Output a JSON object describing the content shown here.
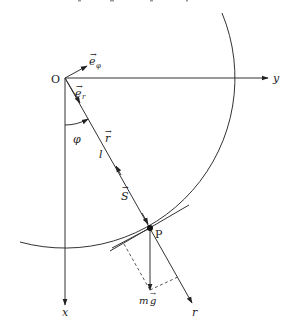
{
  "diagram": {
    "labels": {
      "origin": "O",
      "e_phi": "e",
      "e_phi_sub": "φ",
      "e_r": "e",
      "e_r_sub": "r",
      "y_axis": "y",
      "x_axis": "x",
      "phi": "φ",
      "r_vec": "r",
      "length": "l",
      "tension": "S",
      "point": "P",
      "weight_m": "m",
      "weight_g": "g",
      "r_axis": "r"
    },
    "colors": {
      "stroke": "#333333",
      "background": "#ffffff"
    },
    "geometry": {
      "origin": [
        65,
        78
      ],
      "point_P": [
        150,
        228
      ],
      "circle_radius": 170
    }
  }
}
